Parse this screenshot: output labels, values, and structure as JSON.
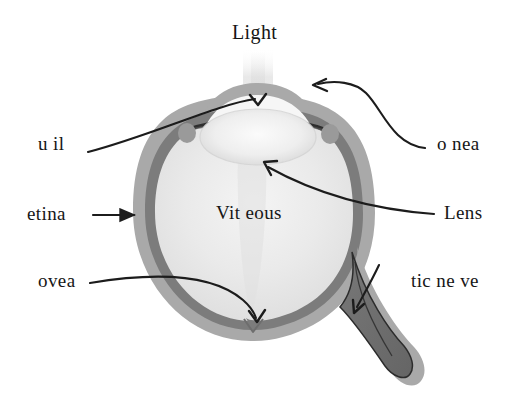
{
  "diagram": {
    "type": "anatomical-diagram",
    "background_color": "#ffffff",
    "labels": {
      "light": "Light",
      "pupil": "u  il",
      "cornea": "o nea",
      "retina": "etina",
      "lens": "Lens",
      "fovea": "ovea",
      "optic_nerve": "tic ne ve",
      "vitreous": "Vit eous"
    },
    "colors": {
      "sclera_ring": "#a9a9a9",
      "choroid_ring": "#7c7c7c",
      "vitreous_fill": "#ebebeb",
      "lens_fill": "#f2f2f2",
      "optic_nerve_fill": "#6f6f6f",
      "outline": "#2a2a2a",
      "arrow": "#1c1c1c",
      "text": "#161616",
      "light_beam": "#e9e9e9"
    },
    "parts": [
      {
        "name": "light-beam",
        "description": "faint vertical beam entering through cornea"
      },
      {
        "name": "cornea",
        "description": "transparent dome at top of eyeball"
      },
      {
        "name": "pupil",
        "description": "opening between iris edges"
      },
      {
        "name": "iris",
        "description": "dark curved bands flanking the pupil"
      },
      {
        "name": "lens",
        "description": "pale oval body behind the pupil"
      },
      {
        "name": "vitreous",
        "description": "large pale interior chamber"
      },
      {
        "name": "retina",
        "description": "inner darker ring lining the eyeball"
      },
      {
        "name": "sclera",
        "description": "outer gray ring of the eyeball"
      },
      {
        "name": "fovea",
        "description": "small notch at the bottom of the retina"
      },
      {
        "name": "optic-nerve",
        "description": "dark wedge extending to the lower right"
      }
    ],
    "arrows": [
      {
        "name": "pupil-arrow",
        "from": "u  il label",
        "to": "pupil opening"
      },
      {
        "name": "cornea-arrow",
        "from": "o nea label",
        "to": "corneal dome"
      },
      {
        "name": "retina-arrow",
        "from": "etina label",
        "to": "retinal ring, left side"
      },
      {
        "name": "lens-arrow",
        "from": "Lens label",
        "to": "underside of lens"
      },
      {
        "name": "fovea-arrow",
        "from": "ovea label",
        "to": "fovea notch"
      },
      {
        "name": "optic-nerve-arrow",
        "from": "tic ne ve label",
        "to": "optic nerve wedge"
      }
    ]
  }
}
